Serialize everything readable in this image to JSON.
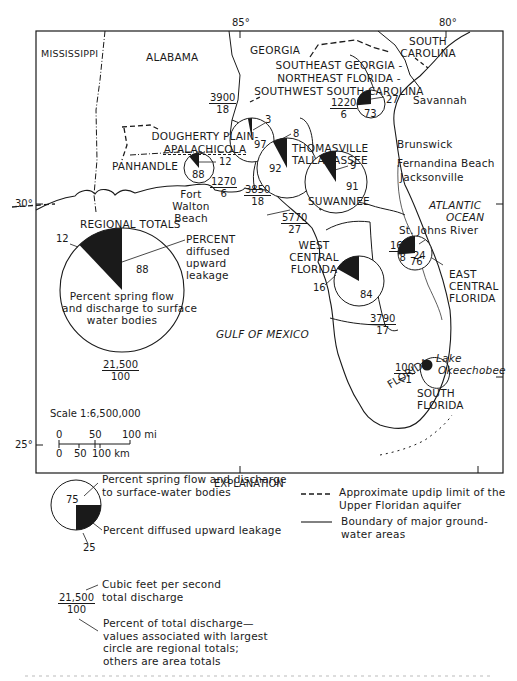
{
  "map": {
    "longitudes": [
      "85°",
      "80°"
    ],
    "latitudes": [
      "30°",
      "25°"
    ],
    "states": {
      "mississippi": "MISSISSIPPI",
      "alabama": "ALABAMA",
      "georgia": "GEORGIA",
      "south_carolina_1": "SOUTH",
      "south_carolina_2": "CAROLINA",
      "florida": "FLORIDA"
    },
    "water": {
      "gulf": "GULF OF MEXICO",
      "atlantic_1": "ATLANTIC",
      "atlantic_2": "OCEAN",
      "st_johns": "St. Johns River",
      "lake_1": "Lake",
      "lake_2": "Okeechobee"
    },
    "cities": {
      "savannah": "Savannah",
      "brunswick": "Brunswick",
      "fernandina": "Fernandina Beach",
      "jacksonville": "Jacksonville",
      "fort_walton_1": "Fort",
      "fort_walton_2": "Walton",
      "fort_walton_3": "Beach"
    },
    "scale": {
      "label": "Scale 1:6,500,000",
      "mi_ticks": [
        "0",
        "50",
        "100 mi"
      ],
      "km_ticks": [
        "0",
        "50",
        "100 km"
      ]
    }
  },
  "areas": {
    "se_georgia": {
      "name_1": "SOUTHEAST GEORGIA -",
      "name_2": "NORTHEAST FLORIDA -",
      "name_3": "SOUTHWEST SOUTH CAROLINA",
      "flow": "1220",
      "pct": "6",
      "leak": "27",
      "spring": "73"
    },
    "dougherty": {
      "name_1": "DOUGHERTY PLAIN-",
      "name_2": "APALACHICOLA",
      "flow": "3900",
      "pct": "18",
      "leak": "3",
      "spring": "97"
    },
    "thomasville": {
      "name_1": "THOMASVILLE",
      "name_2": "TALLAHASSEE",
      "flow": "3850",
      "pct": "18",
      "leak": "8",
      "spring": "92"
    },
    "panhandle": {
      "name": "PANHANDLE",
      "flow": "1270",
      "pct": "6",
      "leak": "12",
      "spring": "88"
    },
    "suwannee": {
      "name": "SUWANNEE",
      "flow": "5770",
      "pct": "27",
      "leak": "9",
      "spring": "91"
    },
    "west_central": {
      "name_1": "WEST",
      "name_2": "CENTRAL",
      "name_3": "FLORIDA",
      "flow": "3790",
      "pct": "17",
      "leak": "16",
      "spring": "84"
    },
    "east_central": {
      "name_1": "EAST",
      "name_2": "CENTRAL",
      "name_3": "FLORIDA",
      "flow": "1640",
      "pct": "8",
      "leak": "24",
      "spring": "76"
    },
    "south_florida": {
      "name_1": "SOUTH",
      "name_2": "FLORIDA",
      "flow": "100",
      "pct": "<1"
    }
  },
  "regional": {
    "title": "REGIONAL TOTALS",
    "leak": "12",
    "spring": "88",
    "leak_label_1": "PERCENT",
    "leak_label_2": "diffused",
    "leak_label_3": "upward",
    "leak_label_4": "leakage",
    "spring_label_1": "Percent spring flow",
    "spring_label_2": "and discharge to surface",
    "spring_label_3": "water bodies",
    "flow": "21,500",
    "pct": "100"
  },
  "explanation": {
    "title": "EXPLANATION",
    "pie_spring": "75",
    "pie_leak": "25",
    "spring_text_1": "Percent spring flow and discharge",
    "spring_text_2": "to surface-water bodies",
    "leak_text": "Percent diffused upward leakage",
    "flow_text_1": "Cubic feet per second",
    "flow_text_2": "total discharge",
    "flow": "21,500",
    "pct": "100",
    "pct_text_1": "Percent of total discharge—",
    "pct_text_2": "values associated with largest",
    "pct_text_3": "circle are regional totals;",
    "pct_text_4": "others are area totals",
    "dashed_text_1": "Approximate updip limit of the",
    "dashed_text_2": "Upper Floridan aquifer",
    "solid_text_1": "Boundary of major ground-",
    "solid_text_2": "water areas"
  }
}
